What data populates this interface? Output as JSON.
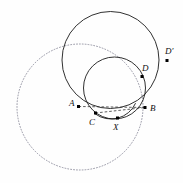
{
  "figure": {
    "background_color": "#fefefe",
    "stroke_color": "#1a1a1a",
    "dotted_color": "#8a8a9a",
    "dashed_color": "#333333",
    "point_color": "#000000",
    "width": 183,
    "height": 183
  },
  "circles": [
    {
      "name": "large-solid-circle",
      "style": "solid",
      "cx": 110.5,
      "cy": 60.0,
      "r": 48.5,
      "stroke": "#1a1a1a",
      "stroke_width": 0.9
    },
    {
      "name": "medium-solid-circle",
      "style": "solid",
      "cx": 114.5,
      "cy": 88.0,
      "r": 31.0,
      "stroke": "#1a1a1a",
      "stroke_width": 0.9
    },
    {
      "name": "dotted-circle",
      "style": "dotted",
      "cx": 80.0,
      "cy": 107.0,
      "r": 63.0,
      "stroke": "#8a8a9a",
      "stroke_width": 0.9
    },
    {
      "name": "small-arc-through-C-X-B",
      "style": "solid-arc",
      "cx": 111.0,
      "cy": 92.0,
      "r": 27.0,
      "stroke": "#1a1a1a",
      "stroke_width": 0.9
    }
  ],
  "points": [
    {
      "name": "point-A",
      "label": "A",
      "x": 78.5,
      "y": 106.5,
      "label_x": 69.0,
      "label_y": 99.0
    },
    {
      "name": "point-B",
      "label": "B",
      "x": 145.0,
      "y": 107.5,
      "label_x": 150.0,
      "label_y": 104.0
    },
    {
      "name": "point-C",
      "label": "C",
      "x": 95.5,
      "y": 113.0,
      "label_x": 89.0,
      "label_y": 118.0
    },
    {
      "name": "point-X",
      "label": "X",
      "x": 117.5,
      "y": 118.0,
      "label_x": 113.0,
      "label_y": 123.0
    },
    {
      "name": "point-D",
      "label": "D",
      "x": 142.0,
      "y": 76.5,
      "label_x": 142.0,
      "label_y": 64.0
    },
    {
      "name": "point-Dp",
      "label": "D′",
      "x": 167.0,
      "y": 60.5,
      "label_x": 165.0,
      "label_y": 47.0
    }
  ],
  "segments": [
    {
      "name": "dashed-chord-A-B",
      "style": "dashed",
      "from": "A",
      "to": "B",
      "x1": 78.5,
      "y1": 106.5,
      "x2": 145.0,
      "y2": 107.5
    },
    {
      "name": "dashed-chord-C-B",
      "style": "dashed",
      "from": "C",
      "to": "B",
      "x1": 95.5,
      "y1": 113.0,
      "x2": 145.0,
      "y2": 107.5
    }
  ],
  "point_marker": {
    "shape": "square",
    "size": 3.0,
    "color": "#000000"
  }
}
